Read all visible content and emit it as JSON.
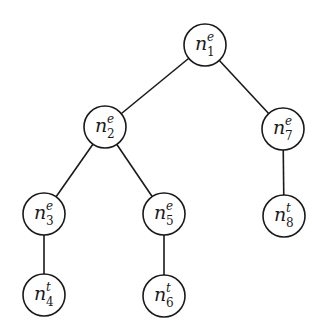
{
  "diagram": {
    "type": "tree",
    "nodes": [
      {
        "id": "n1",
        "base": "n",
        "sub": "1",
        "sup": "e",
        "cx": 205,
        "cy": 45
      },
      {
        "id": "n2",
        "base": "n",
        "sub": "2",
        "sup": "e",
        "cx": 105,
        "cy": 127
      },
      {
        "id": "n7",
        "base": "n",
        "sub": "7",
        "sup": "e",
        "cx": 283,
        "cy": 129
      },
      {
        "id": "n3",
        "base": "n",
        "sub": "3",
        "sup": "e",
        "cx": 44,
        "cy": 214
      },
      {
        "id": "n5",
        "base": "n",
        "sub": "5",
        "sup": "e",
        "cx": 164,
        "cy": 214
      },
      {
        "id": "n8",
        "base": "n",
        "sub": "8",
        "sup": "t",
        "cx": 284,
        "cy": 216
      },
      {
        "id": "n4",
        "base": "n",
        "sub": "4",
        "sup": "t",
        "cx": 44,
        "cy": 295
      },
      {
        "id": "n6",
        "base": "n",
        "sub": "6",
        "sup": "t",
        "cx": 164,
        "cy": 296
      }
    ],
    "edges": [
      [
        "n1",
        "n2"
      ],
      [
        "n1",
        "n7"
      ],
      [
        "n2",
        "n3"
      ],
      [
        "n2",
        "n5"
      ],
      [
        "n7",
        "n8"
      ],
      [
        "n3",
        "n4"
      ],
      [
        "n5",
        "n6"
      ]
    ],
    "node_radius": 21
  }
}
